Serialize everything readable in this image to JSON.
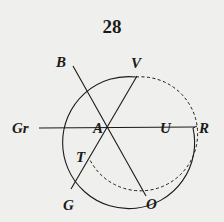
{
  "page_number": "28",
  "diagram": {
    "center_label": "A",
    "labels": {
      "B": "B",
      "V": "V",
      "Gr": "Gr",
      "A": "A",
      "U": "U",
      "R": "R",
      "T": "T",
      "G": "G",
      "O": "O"
    },
    "colors": {
      "ink": "#1a1a1a",
      "paper": "#efefed"
    }
  }
}
